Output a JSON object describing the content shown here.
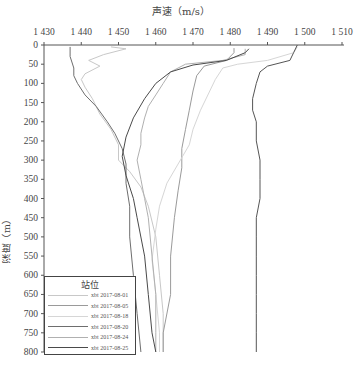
{
  "chart_data": {
    "type": "line",
    "title": "",
    "xlabel": "声速（m/s）",
    "ylabel": "深度（m）",
    "x_axis_position": "top",
    "xlim": [
      1430,
      1510
    ],
    "ylim": [
      0,
      800
    ],
    "y_inverted": true,
    "xticks": [
      "1 430",
      "1 440",
      "1 450",
      "1 460",
      "1 470",
      "1 480",
      "1 490",
      "1 500",
      "1 510"
    ],
    "yticks": [
      "0",
      "50",
      "100",
      "150",
      "200",
      "250",
      "300",
      "350",
      "400",
      "450",
      "500",
      "550",
      "600",
      "650",
      "700",
      "750",
      "800"
    ],
    "grid": false,
    "legend_title": "站位",
    "legend_position": "lower-left",
    "series": [
      {
        "name": "xbt 2017-08-01",
        "color": "#c8c8c8",
        "points": [
          [
            1448,
            5
          ],
          [
            1452,
            10
          ],
          [
            1446,
            25
          ],
          [
            1442,
            40
          ],
          [
            1445,
            55
          ],
          [
            1441,
            75
          ],
          [
            1440,
            90
          ],
          [
            1441,
            110
          ],
          [
            1443,
            140
          ],
          [
            1445,
            180
          ],
          [
            1448,
            220
          ],
          [
            1450,
            260
          ],
          [
            1450,
            300
          ],
          [
            1453,
            330
          ],
          [
            1456,
            370
          ],
          [
            1458,
            420
          ],
          [
            1460,
            500
          ],
          [
            1461,
            600
          ],
          [
            1462,
            700
          ],
          [
            1462,
            800
          ]
        ]
      },
      {
        "name": "xbt 2017-08-05",
        "color": "#9a9a9a",
        "points": [
          [
            1481,
            8
          ],
          [
            1481,
            20
          ],
          [
            1479,
            40
          ],
          [
            1473,
            55
          ],
          [
            1471,
            80
          ],
          [
            1470,
            120
          ],
          [
            1469,
            170
          ],
          [
            1468,
            220
          ],
          [
            1467,
            270
          ],
          [
            1467,
            320
          ],
          [
            1466,
            380
          ],
          [
            1465,
            450
          ],
          [
            1464,
            550
          ],
          [
            1464,
            650
          ],
          [
            1462,
            750
          ],
          [
            1462,
            800
          ]
        ]
      },
      {
        "name": "xbt 2017-08-18",
        "color": "#d6d6d6",
        "points": [
          [
            1498,
            5
          ],
          [
            1497,
            20
          ],
          [
            1490,
            40
          ],
          [
            1482,
            50
          ],
          [
            1478,
            60
          ],
          [
            1476,
            90
          ],
          [
            1474,
            130
          ],
          [
            1472,
            170
          ],
          [
            1470,
            220
          ],
          [
            1469,
            260
          ],
          [
            1466,
            310
          ],
          [
            1463,
            360
          ],
          [
            1461,
            420
          ],
          [
            1460,
            480
          ],
          [
            1459,
            560
          ],
          [
            1460,
            650
          ],
          [
            1461,
            750
          ],
          [
            1461,
            800
          ]
        ]
      },
      {
        "name": "xbt 2017-08-20",
        "color": "#6e6e6e",
        "points": [
          [
            1437,
            5
          ],
          [
            1437,
            30
          ],
          [
            1438,
            60
          ],
          [
            1438,
            80
          ],
          [
            1439,
            100
          ],
          [
            1441,
            130
          ],
          [
            1444,
            160
          ],
          [
            1447,
            200
          ],
          [
            1449,
            230
          ],
          [
            1451,
            270
          ],
          [
            1452,
            310
          ],
          [
            1452,
            360
          ],
          [
            1453,
            420
          ],
          [
            1453,
            500
          ],
          [
            1454,
            600
          ],
          [
            1455,
            700
          ],
          [
            1456,
            800
          ]
        ]
      },
      {
        "name": "xbt 2017-08-24",
        "color": "#b0b0b0",
        "points": [
          [
            1484,
            10
          ],
          [
            1484,
            25
          ],
          [
            1478,
            40
          ],
          [
            1468,
            50
          ],
          [
            1464,
            70
          ],
          [
            1462,
            100
          ],
          [
            1460,
            130
          ],
          [
            1458,
            160
          ],
          [
            1457,
            190
          ],
          [
            1456,
            230
          ],
          [
            1456,
            260
          ],
          [
            1455,
            300
          ],
          [
            1456,
            350
          ],
          [
            1457,
            400
          ],
          [
            1458,
            450
          ],
          [
            1459,
            550
          ],
          [
            1460,
            650
          ],
          [
            1460,
            750
          ],
          [
            1460,
            800
          ]
        ]
      },
      {
        "name": "xbt 2017-08-25",
        "color": "#4a4a4a",
        "points": [
          [
            1485,
            10
          ],
          [
            1484,
            20
          ],
          [
            1479,
            40
          ],
          [
            1470,
            52
          ],
          [
            1464,
            70
          ],
          [
            1460,
            100
          ],
          [
            1457,
            140
          ],
          [
            1454,
            190
          ],
          [
            1452,
            240
          ],
          [
            1451,
            290
          ],
          [
            1452,
            340
          ],
          [
            1454,
            400
          ],
          [
            1455,
            450
          ],
          [
            1457,
            550
          ],
          [
            1458,
            650
          ],
          [
            1459,
            750
          ],
          [
            1460,
            800
          ]
        ]
      },
      {
        "name": "profile-right-dark",
        "color": "#555555",
        "points": [
          [
            1498,
            0
          ],
          [
            1497,
            20
          ],
          [
            1496,
            40
          ],
          [
            1490,
            55
          ],
          [
            1488,
            70
          ],
          [
            1487,
            100
          ],
          [
            1486,
            140
          ],
          [
            1486,
            170
          ],
          [
            1487,
            200
          ],
          [
            1487,
            250
          ],
          [
            1488,
            300
          ],
          [
            1488,
            350
          ],
          [
            1488,
            400
          ],
          [
            1487,
            450
          ],
          [
            1487,
            500
          ],
          [
            1487,
            550
          ],
          [
            1487,
            600
          ],
          [
            1487,
            650
          ],
          [
            1487,
            700
          ],
          [
            1487,
            750
          ],
          [
            1487,
            800
          ]
        ]
      }
    ]
  }
}
